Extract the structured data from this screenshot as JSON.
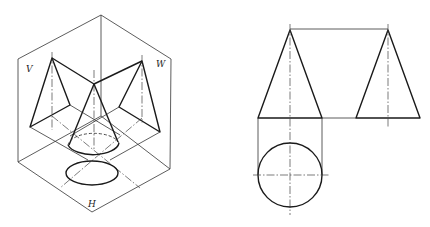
{
  "figure": {
    "left_view": {
      "type": "isometric-projection-box",
      "plane_labels": {
        "v": "V",
        "w": "W",
        "h": "H"
      },
      "object": "cone"
    },
    "right_view": {
      "type": "three-view-orthographic",
      "views": [
        "front-view-triangle",
        "side-view-triangle",
        "top-view-circle"
      ],
      "object": "cone"
    }
  },
  "colors": {
    "line": "#1a1a1a",
    "background": "#ffffff"
  }
}
